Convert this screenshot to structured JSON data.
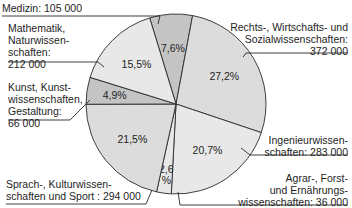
{
  "chart_data": {
    "type": "pie",
    "title": "",
    "start_angle_deg": -17,
    "slices": [
      {
        "name": "Medizin",
        "value": 105000,
        "percent_label": "7,6%",
        "label_lines": [
          "Medizin: 105 000"
        ],
        "shade": "dark"
      },
      {
        "name": "Rechts-, Wirtschafts- und Sozialwissenschaften",
        "value": 372000,
        "percent_label": "27,2%",
        "label_lines": [
          "Rechts-, Wirtschafts- und",
          "Sozialwissenschaften:",
          "372 000"
        ],
        "shade": "light"
      },
      {
        "name": "Ingenieurwissenschaften",
        "value": 283000,
        "percent_label": "20,7%",
        "label_lines": [
          "Ingenieurwissen-",
          "schaften: 283 000"
        ],
        "shade": "lighter"
      },
      {
        "name": "Agrar-, Forst- und Ernährungswissenschaften",
        "value": 36000,
        "percent_label": "2,6 %",
        "label_lines": [
          "Agrar-, Forst-",
          "und Ernährungs-",
          "wissenschaften: 36 000"
        ],
        "shade": "lighter"
      },
      {
        "name": "Sprach-, Kulturwissenschaften und Sport",
        "value": 294000,
        "percent_label": "21,5%",
        "label_lines": [
          "Sprach-, Kulturwissen-",
          "schaften und Sport : 294 000"
        ],
        "shade": "light"
      },
      {
        "name": "Kunst, Kunstwissenschaften, Gestaltung",
        "value": 66000,
        "percent_label": "4,9%",
        "label_lines": [
          "Kunst, Kunst-",
          "wissenschaften,",
          "Gestaltung:",
          "66 000"
        ],
        "shade": "dark"
      },
      {
        "name": "Mathematik, Naturwissenschaften",
        "value": 212000,
        "percent_label": "15,5%",
        "label_lines": [
          "Mathematik,",
          "Naturwissen-",
          "schaften:",
          "212 000"
        ],
        "shade": "lighter"
      }
    ],
    "colors": {
      "dark": "#c4c4c4",
      "light": "#dcdcdc",
      "lighter": "#e8e8e8",
      "stroke": "#2a2a2a"
    }
  }
}
